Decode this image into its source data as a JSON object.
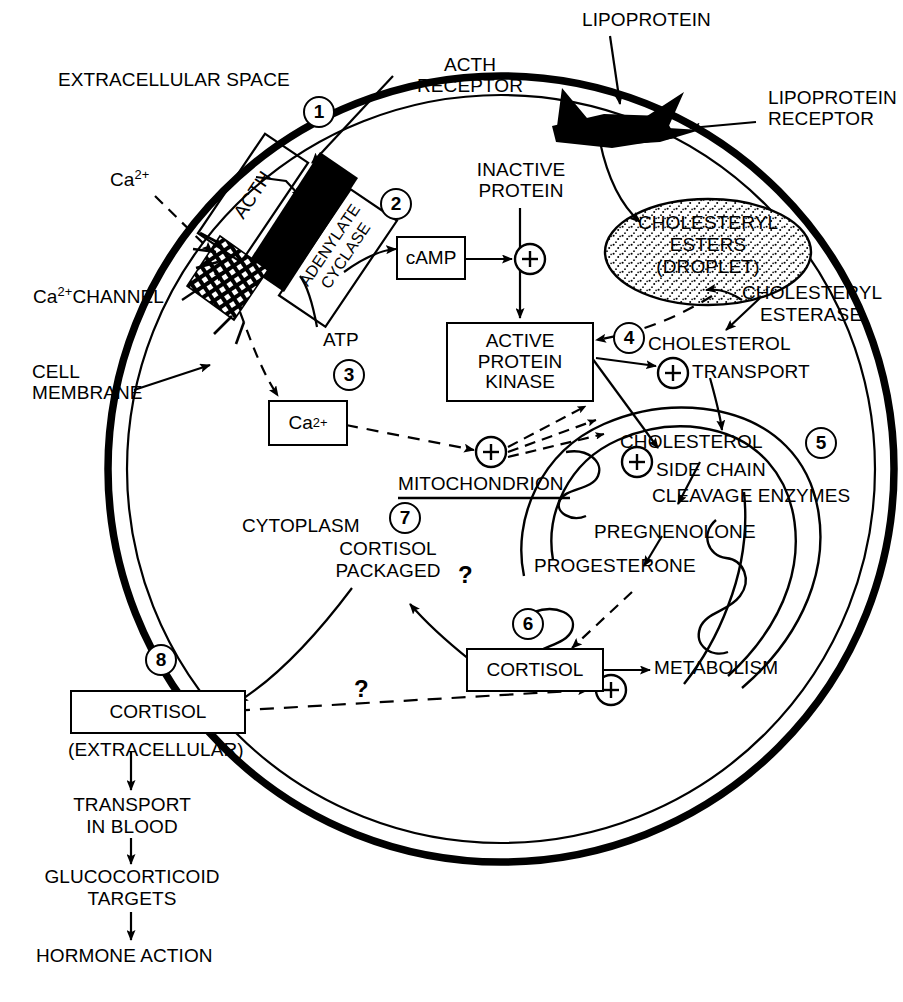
{
  "diagram": {
    "colors": {
      "ink": "#000000",
      "background": "#ffffff"
    }
  },
  "labels": {
    "extracellular_space": "EXTRACELLULAR SPACE",
    "acth_receptor": "ACTH\nRECEPTOR",
    "lipoprotein": "LIPOPROTEIN",
    "lipoprotein_receptor": "LIPOPROTEIN\nRECEPTOR",
    "acth": "ACTH",
    "adenylate_cyclase": "ADENYLATE\nCYCLASE",
    "calcium_ion": "Ca",
    "calcium_ion_sup": "2+",
    "calcium_channel": "CHANNEL",
    "cell_membrane": "CELL\nMEMBRANE",
    "camp": "cAMP",
    "atp": "ATP",
    "inactive_protein": "INACTIVE\nPROTEIN",
    "active_protein_kinase": "ACTIVE\nPROTEIN\nKINASE",
    "cholesteryl_esters_droplet": "CHOLESTERYL\nESTERS\n(DROPLET)",
    "cholesteryl_esterase": "CHOLESTERYL\nESTERASE",
    "cholesterol_transport": "CHOLESTEROL\nTRANSPORT",
    "cholesterol_scc": "CHOLESTEROL\nSIDE CHAIN\nCLEAVAGE ENZYMES",
    "mitochondrion": "MITOCHONDRION",
    "cytoplasm": "CYTOPLASM",
    "pregnenolone": "PREGNENOLONE",
    "progesterone": "PROGESTERONE",
    "cortisol_packaged": "CORTISOL\nPACKAGED",
    "cortisol": "CORTISOL",
    "metabolism": "METABOLISM",
    "cortisol_extracellular_box": "CORTISOL",
    "extracellular_paren": "(EXTRACELLULAR)",
    "transport_in_blood": "TRANSPORT\nIN BLOOD",
    "glucocorticoid_targets": "GLUCOCORTICOID\nTARGETS",
    "hormone_action": "HORMONE ACTION",
    "question_mark": "?"
  },
  "step_numbers": [
    {
      "id": 1,
      "value": "1"
    },
    {
      "id": 2,
      "value": "2"
    },
    {
      "id": 3,
      "value": "3"
    },
    {
      "id": 4,
      "value": "4"
    },
    {
      "id": 5,
      "value": "5"
    },
    {
      "id": 6,
      "value": "6"
    },
    {
      "id": 7,
      "value": "7"
    },
    {
      "id": 8,
      "value": "8"
    }
  ],
  "plus_nodes": [
    {
      "id": "camp-activation",
      "symbol": "+"
    },
    {
      "id": "cholesterol-transport-activation",
      "symbol": "+"
    },
    {
      "id": "mitochondrion-activation",
      "symbol": "+"
    },
    {
      "id": "scc-activation",
      "symbol": "+"
    },
    {
      "id": "cortisol-feedback-activation",
      "symbol": "+"
    }
  ],
  "multiline_labels": {
    "acth_receptor": [
      "ACTH",
      "RECEPTOR"
    ],
    "lipoprotein_receptor": [
      "LIPOPROTEIN",
      "RECEPTOR"
    ],
    "adenylate_cyclase": [
      "ADENYLATE",
      "CYCLASE"
    ],
    "cell_membrane": [
      "CELL",
      "MEMBRANE"
    ],
    "inactive_protein": [
      "INACTIVE",
      "PROTEIN"
    ],
    "active_protein_kinase": [
      "ACTIVE",
      "PROTEIN",
      "KINASE"
    ],
    "cholesteryl_esters_droplet": [
      "CHOLESTERYL",
      "ESTERS",
      "(DROPLET)"
    ],
    "cholesteryl_esterase": [
      "CHOLESTERYL",
      "ESTERASE"
    ],
    "cholesterol_transport": [
      "CHOLESTEROL",
      "TRANSPORT"
    ],
    "cholesterol_scc": [
      "CHOLESTEROL",
      "SIDE CHAIN",
      "CLEAVAGE ENZYMES"
    ],
    "cortisol_packaged": [
      "CORTISOL",
      "PACKAGED"
    ],
    "transport_in_blood": [
      "TRANSPORT",
      "IN BLOOD"
    ],
    "glucocorticoid_targets": [
      "GLUCOCORTICOID",
      "TARGETS"
    ]
  }
}
